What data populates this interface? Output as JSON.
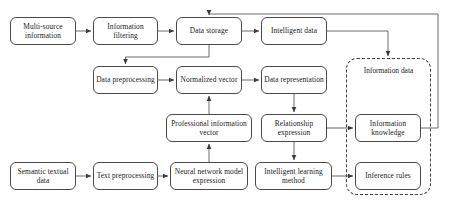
{
  "diagram": {
    "type": "flowchart",
    "canvas": {
      "width": 454,
      "height": 204
    },
    "style": {
      "node_border_color": "#4a4a4a",
      "node_fill_color": "#ffffff",
      "connector_color": "#555555",
      "group_border_color": "#3d3d3d",
      "background_color": "#ffffff",
      "text_color": "#1a1a1a"
    },
    "nodes": [
      {
        "id": "multi_source_information",
        "label": "Multi-source information",
        "row": 1,
        "x": 10,
        "y": 17,
        "w": 66,
        "h": 28
      },
      {
        "id": "information_filtering",
        "label": "Information filtering",
        "row": 1,
        "x": 93,
        "y": 17,
        "w": 65,
        "h": 28
      },
      {
        "id": "data_storage",
        "label": "Data storage",
        "row": 1,
        "x": 176,
        "y": 17,
        "w": 66,
        "h": 28
      },
      {
        "id": "intelligent_data",
        "label": "Intelligent data",
        "row": 1,
        "x": 261,
        "y": 17,
        "w": 66,
        "h": 28
      },
      {
        "id": "data_preprocessing",
        "label": "Data preprocessing",
        "row": 2,
        "x": 93,
        "y": 66,
        "w": 65,
        "h": 28
      },
      {
        "id": "normalized_vector",
        "label": "Normalized vector",
        "row": 2,
        "x": 176,
        "y": 66,
        "w": 66,
        "h": 28
      },
      {
        "id": "data_representation",
        "label": "Data representation",
        "row": 2,
        "x": 261,
        "y": 66,
        "w": 66,
        "h": 28
      },
      {
        "id": "professional_information_vector",
        "label": "Professional information vector",
        "row": 3,
        "x": 166,
        "y": 114,
        "w": 86,
        "h": 28
      },
      {
        "id": "relationship_expression",
        "label": "Relationship expression",
        "row": 3,
        "x": 261,
        "y": 114,
        "w": 66,
        "h": 28
      },
      {
        "id": "information_knowledge",
        "label": "Information knowledge",
        "row": 3,
        "x": 355,
        "y": 114,
        "w": 66,
        "h": 28
      },
      {
        "id": "semantic_textual_data",
        "label": "Semantic textual data",
        "row": 4,
        "x": 10,
        "y": 162,
        "w": 66,
        "h": 28
      },
      {
        "id": "text_preprocessing",
        "label": "Text preprocessing",
        "row": 4,
        "x": 93,
        "y": 162,
        "w": 65,
        "h": 28
      },
      {
        "id": "neural_network_model_expression",
        "label": "Neural network model expression",
        "row": 4,
        "x": 170,
        "y": 162,
        "w": 78,
        "h": 28
      },
      {
        "id": "intelligent_learning_method",
        "label": "Intelligent learning method",
        "row": 4,
        "x": 255,
        "y": 162,
        "w": 77,
        "h": 28
      },
      {
        "id": "inference_rules",
        "label": "Inference rules",
        "row": 4,
        "x": 355,
        "y": 162,
        "w": 66,
        "h": 28
      }
    ],
    "groups": [
      {
        "id": "information_data_group",
        "label": "Information data",
        "x": 346,
        "y": 58,
        "w": 85,
        "h": 137,
        "title_x": 346,
        "title_y": 66,
        "title_w": 85,
        "contains": [
          "information_knowledge",
          "inference_rules"
        ]
      }
    ],
    "edges": [
      {
        "from": "multi_source_information",
        "to": "information_filtering",
        "kind": "arrow"
      },
      {
        "from": "information_filtering",
        "to": "data_storage",
        "kind": "arrow"
      },
      {
        "from": "data_storage",
        "to": "intelligent_data",
        "kind": "arrow"
      },
      {
        "from": "data_storage",
        "to": "data_preprocessing",
        "kind": "elbow-arrow"
      },
      {
        "from": "data_preprocessing",
        "to": "normalized_vector",
        "kind": "arrow"
      },
      {
        "from": "normalized_vector",
        "to": "data_representation",
        "kind": "arrow"
      },
      {
        "from": "data_representation",
        "to": "relationship_expression",
        "kind": "arrow"
      },
      {
        "from": "relationship_expression",
        "to": "information_knowledge",
        "kind": "arrow"
      },
      {
        "from": "relationship_expression",
        "to": "intelligent_learning_method",
        "kind": "arrow"
      },
      {
        "from": "intelligent_learning_method",
        "to": "inference_rules",
        "kind": "arrow"
      },
      {
        "from": "semantic_textual_data",
        "to": "text_preprocessing",
        "kind": "arrow"
      },
      {
        "from": "text_preprocessing",
        "to": "neural_network_model_expression",
        "kind": "arrow"
      },
      {
        "from": "neural_network_model_expression",
        "to": "professional_information_vector",
        "kind": "arrow"
      },
      {
        "from": "professional_information_vector",
        "to": "normalized_vector",
        "kind": "arrow"
      },
      {
        "from": "intelligent_data",
        "to": "information_data_group",
        "kind": "elbow-arrow"
      },
      {
        "from": "information_knowledge",
        "to": "data_storage",
        "kind": "feedback-loop"
      }
    ]
  }
}
